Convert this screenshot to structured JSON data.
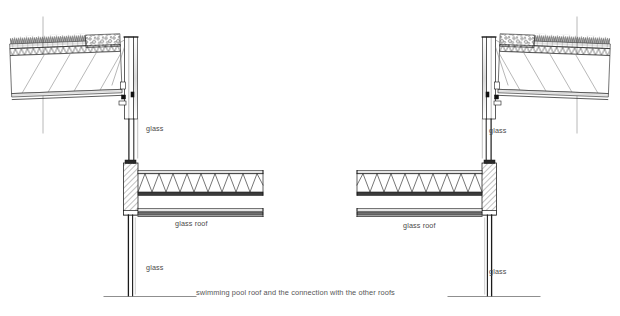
{
  "drawing": {
    "title_caption": "swimming pool roof and the connection with the other roofs",
    "type": "architectural-section",
    "background_color": "#ffffff",
    "line_color": "#1a1a1a",
    "text_color": "#4a4a4a",
    "labels": [
      {
        "id": "glass-left-upper",
        "text": "glass",
        "x": 146,
        "y": 129
      },
      {
        "id": "glass-roof-left",
        "text": "glass roof",
        "x": 175,
        "y": 224
      },
      {
        "id": "glass-left-lower",
        "text": "glass",
        "x": 146,
        "y": 268
      },
      {
        "id": "glass-right-upper",
        "text": "glass",
        "x": 489,
        "y": 131
      },
      {
        "id": "glass-roof-right",
        "text": "glass roof",
        "x": 403,
        "y": 226
      },
      {
        "id": "glass-right-lower",
        "text": "glass",
        "x": 489,
        "y": 272
      }
    ],
    "caption": {
      "text": "swimming pool roof and the connection with the other roofs",
      "x": 196,
      "y": 292
    },
    "assemblies": {
      "left_sloped_roof": {
        "name": "green roof build-up (sloped)",
        "layers": [
          "vegetation",
          "substrate / soil",
          "insulation (triangular hatch)",
          "gravel ballast",
          "structural deck / truss void",
          "ceiling soffit"
        ]
      },
      "right_sloped_roof": {
        "name": "green roof build-up (sloped, mirrored)",
        "layers": [
          "vegetation",
          "substrate / soil",
          "insulation (triangular hatch)",
          "gravel ballast",
          "structural deck / truss void",
          "ceiling soffit"
        ]
      },
      "horizontal_glass_roof": {
        "name": "glass roof with zig-zag space truss",
        "elements": [
          "upper glazing pane",
          "zig-zag truss",
          "lower glazing pane",
          "edge beam"
        ]
      },
      "columns": {
        "name": "hatched concrete / masonry pier with glass curtain wall below",
        "hatch": "diagonal-45"
      },
      "ground_line": {
        "name": "ground / datum line"
      }
    }
  }
}
